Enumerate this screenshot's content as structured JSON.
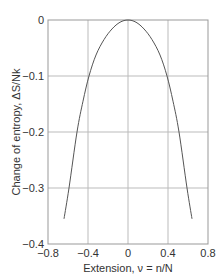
{
  "chart_data": {
    "type": "line",
    "title": "",
    "xlabel": "Extension, ν = n/N",
    "ylabel": "Change of entropy, ΔS/Nk",
    "xlim": [
      -0.8,
      0.8
    ],
    "ylim": [
      -0.4,
      0
    ],
    "xticks": [
      -0.8,
      -0.4,
      0,
      0.4,
      0.8
    ],
    "xtick_labels": [
      "−0.8",
      "−0.4",
      "0",
      "0.4",
      "0.8"
    ],
    "yticks": [
      0,
      -0.1,
      -0.2,
      -0.3,
      -0.4
    ],
    "ytick_labels": [
      "0",
      "−0.1",
      "−0.2",
      "−0.3",
      "−0.4"
    ],
    "grid": true,
    "legend": null,
    "series": [
      {
        "name": "ΔS/Nk",
        "x": [
          -0.64,
          -0.59,
          -0.51,
          -0.45,
          -0.39,
          -0.32,
          -0.24,
          -0.16,
          -0.08,
          0,
          0.08,
          0.16,
          0.24,
          0.32,
          0.39,
          0.45,
          0.51,
          0.59,
          0.64
        ],
        "y": [
          -0.355,
          -0.3,
          -0.2,
          -0.145,
          -0.1,
          -0.0625,
          -0.035,
          -0.016,
          -0.004,
          0,
          -0.004,
          -0.016,
          -0.035,
          -0.0625,
          -0.1,
          -0.145,
          -0.2,
          -0.3,
          -0.355
        ]
      }
    ]
  },
  "colors": {
    "curve": "#555555",
    "grid": "#bbbbbb",
    "axis": "#888888",
    "text": "#333333"
  }
}
